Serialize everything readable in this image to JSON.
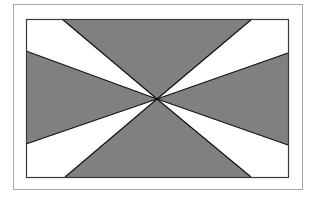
{
  "diagram": {
    "colors": {
      "background": "#ffffff",
      "outer_frame_stroke": "#a8a8a8",
      "inner_frame_stroke": "#3a3a3a",
      "filled_wedge": "#808080",
      "empty_wedge": "#ffffff",
      "ray_stroke": "#111111"
    },
    "outer_frame": {
      "x": 13,
      "y": 4,
      "width": 289,
      "height": 185
    },
    "inner_rect": {
      "x": 26,
      "y": 19,
      "width": 262,
      "height": 158
    },
    "center": {
      "x": 157,
      "y": 99
    },
    "rays": [
      {
        "name": "top-left",
        "x": 62,
        "y": 19
      },
      {
        "name": "top-right",
        "x": 252,
        "y": 19
      },
      {
        "name": "right-upper",
        "x": 288,
        "y": 53
      },
      {
        "name": "right-lower",
        "x": 288,
        "y": 145
      },
      {
        "name": "bottom-right",
        "x": 251,
        "y": 177
      },
      {
        "name": "bottom-left",
        "x": 65,
        "y": 177
      },
      {
        "name": "left-lower",
        "x": 26,
        "y": 144
      },
      {
        "name": "left-upper",
        "x": 26,
        "y": 51
      }
    ],
    "wedges": [
      {
        "name": "top",
        "fill": "gray"
      },
      {
        "name": "top-right",
        "fill": "white"
      },
      {
        "name": "right",
        "fill": "gray"
      },
      {
        "name": "bottom-right",
        "fill": "white"
      },
      {
        "name": "bottom",
        "fill": "gray"
      },
      {
        "name": "bottom-left",
        "fill": "white"
      },
      {
        "name": "left",
        "fill": "gray"
      },
      {
        "name": "top-left",
        "fill": "white"
      }
    ]
  }
}
